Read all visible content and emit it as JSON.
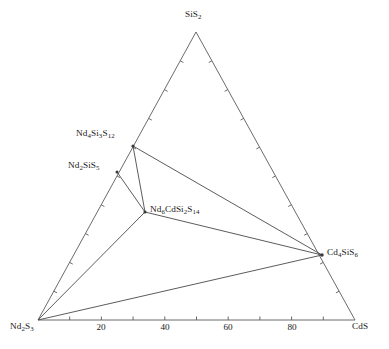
{
  "chart_data": {
    "type": "scatter",
    "title": "",
    "subtitle": "",
    "diagram_kind": "ternary-phase-diagram",
    "xlabel": "",
    "ylabel": "",
    "grid": false,
    "legend_position": "none",
    "axis_range": [
      0,
      100
    ],
    "axis_tick_interval": 10,
    "corners": [
      {
        "id": "SiS2",
        "label_html": "SiS<sub>2</sub>",
        "label_text": "SiS2",
        "position": "top"
      },
      {
        "id": "Nd2S3",
        "label_html": "Nd<sub>2</sub>S<sub>3</sub>",
        "label_text": "Nd2S3",
        "position": "bottom-left"
      },
      {
        "id": "CdS",
        "label_html": "CdS",
        "label_text": "CdS",
        "position": "bottom-right"
      }
    ],
    "bottom_axis_ticks": [
      {
        "value": 20,
        "label": "20"
      },
      {
        "value": 40,
        "label": "40"
      },
      {
        "value": 60,
        "label": "60"
      },
      {
        "value": 80,
        "label": "80"
      }
    ],
    "phases": [
      {
        "id": "Nd4Si3S12",
        "label_html": "Nd<sub>4</sub>Si<sub>3</sub>S<sub>12</sub>",
        "label_text": "Nd4Si3S12",
        "x": 133,
        "y": 146,
        "on_edge": "Nd2S3-SiS2"
      },
      {
        "id": "Nd2SiS5",
        "label_html": "Nd<sub>2</sub>SiS<sub>5</sub>",
        "label_text": "Nd2SiS5",
        "x": 117,
        "y": 172,
        "on_edge": "Nd2S3-SiS2"
      },
      {
        "id": "Nd6CdSi2S14",
        "label_html": "Nd<sub>6</sub>CdSi<sub>2</sub>S<sub>14</sub>",
        "label_text": "Nd6CdSi2S14",
        "x": 145,
        "y": 212,
        "on_edge": "interior"
      },
      {
        "id": "Cd4SiS6",
        "label_html": "Cd<sub>4</sub>SiS<sub>6</sub>",
        "label_text": "Cd4SiS6",
        "x": 322,
        "y": 255,
        "on_edge": "SiS2-CdS"
      }
    ],
    "tie_lines": [
      {
        "from": "Nd4Si3S12",
        "to": "Nd6CdSi2S14"
      },
      {
        "from": "Nd4Si3S12",
        "to": "Cd4SiS6"
      },
      {
        "from": "Nd2SiS5",
        "to": "Nd6CdSi2S14"
      },
      {
        "from": "Nd6CdSi2S14",
        "to": "Cd4SiS6"
      },
      {
        "from": "Nd6CdSi2S14",
        "to": "Nd2S3"
      },
      {
        "from": "Nd2S3",
        "to": "Cd4SiS6"
      }
    ],
    "colors": {
      "line": "#5a5a5a",
      "tie_line": "#4a4a4a",
      "text": "#1a1a1a",
      "background": "#ffffff"
    }
  }
}
